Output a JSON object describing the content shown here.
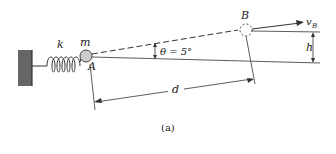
{
  "figure": {
    "caption": "(a)",
    "labels": {
      "spring_constant": "k",
      "mass": "m",
      "point_a": "A",
      "point_b": "B",
      "angle": "θ = 5°",
      "velocity": "v",
      "velocity_sub": "B",
      "height": "h",
      "distance": "d"
    },
    "colors": {
      "wall": "#666666",
      "mass_fill": "#cccccc",
      "line": "#333333"
    }
  }
}
